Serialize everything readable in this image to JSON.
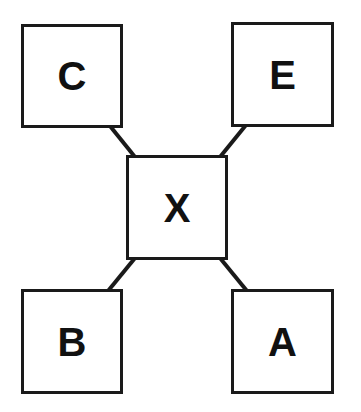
{
  "diagram": {
    "center": {
      "id": "X",
      "label": "X"
    },
    "nodes": [
      {
        "id": "C",
        "label": "C",
        "position": "top-left"
      },
      {
        "id": "E",
        "label": "E",
        "position": "top-right"
      },
      {
        "id": "B",
        "label": "B",
        "position": "bottom-left"
      },
      {
        "id": "A",
        "label": "A",
        "position": "bottom-right"
      }
    ],
    "edges": [
      {
        "from": "X",
        "to": "C"
      },
      {
        "from": "X",
        "to": "E"
      },
      {
        "from": "X",
        "to": "B"
      },
      {
        "from": "X",
        "to": "A"
      }
    ],
    "colors": {
      "stroke": "#1a1a1a",
      "fill": "#ffffff",
      "text": "#111111"
    }
  }
}
